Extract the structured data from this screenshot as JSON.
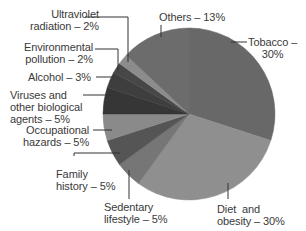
{
  "chart_data": {
    "type": "pie",
    "title": "",
    "start_angle_deg": 0,
    "direction": "clockwise",
    "slices": [
      {
        "label": "Tobacco",
        "value": 30,
        "text": "Tobacco – 30%",
        "color": "#686868"
      },
      {
        "label": "Diet and obesity",
        "value": 30,
        "text": "Diet and obesity – 30%",
        "color": "#8f8f8f"
      },
      {
        "label": "Sedentary lifestyle",
        "value": 5,
        "text": "Sedentary lifestyle – 5%",
        "color": "#767676"
      },
      {
        "label": "Family history",
        "value": 5,
        "text": "Family history – 5%",
        "color": "#555555"
      },
      {
        "label": "Occupational hazards",
        "value": 5,
        "text": "Occupational hazards – 5%",
        "color": "#8a8a8a"
      },
      {
        "label": "Viruses and other biological agents",
        "value": 5,
        "text": "Viruses and other biological agents – 5%",
        "color": "#363636"
      },
      {
        "label": "Alcohol",
        "value": 3,
        "text": "Alcohol – 3%",
        "color": "#3e3e3e"
      },
      {
        "label": "Environmental pollution",
        "value": 2,
        "text": "Environmental pollution – 2%",
        "color": "#474747"
      },
      {
        "label": "Ultraviolet radiation",
        "value": 2,
        "text": "Ultraviolet radiation – 2%",
        "color": "#8c8c8c"
      },
      {
        "label": "Others",
        "value": 13,
        "text": "Others – 13%",
        "color": "#6c6c6c"
      }
    ],
    "legend": "none (leader-line labels)"
  },
  "labels": {
    "uv_1": "Ultraviolet",
    "uv_2": "radiation – 2%",
    "env_1": "Environmental",
    "env_2": "pollution – 2%",
    "alcohol": "Alcohol – 3%",
    "viruses_1": "Viruses and",
    "viruses_2": "other biological",
    "viruses_3": "agents – 5%",
    "occ_1": "Occupational",
    "occ_2": "hazards – 5%",
    "family_1": "Family",
    "family_2": "history – 5%",
    "sed_1": "Sedentary",
    "sed_2": "lifestyle – 5%",
    "diet_1": "Diet  and",
    "diet_2": "obesity – 30%",
    "others": "Others – 13%",
    "tobacco_1": "Tobacco –",
    "tobacco_2": "30%"
  }
}
